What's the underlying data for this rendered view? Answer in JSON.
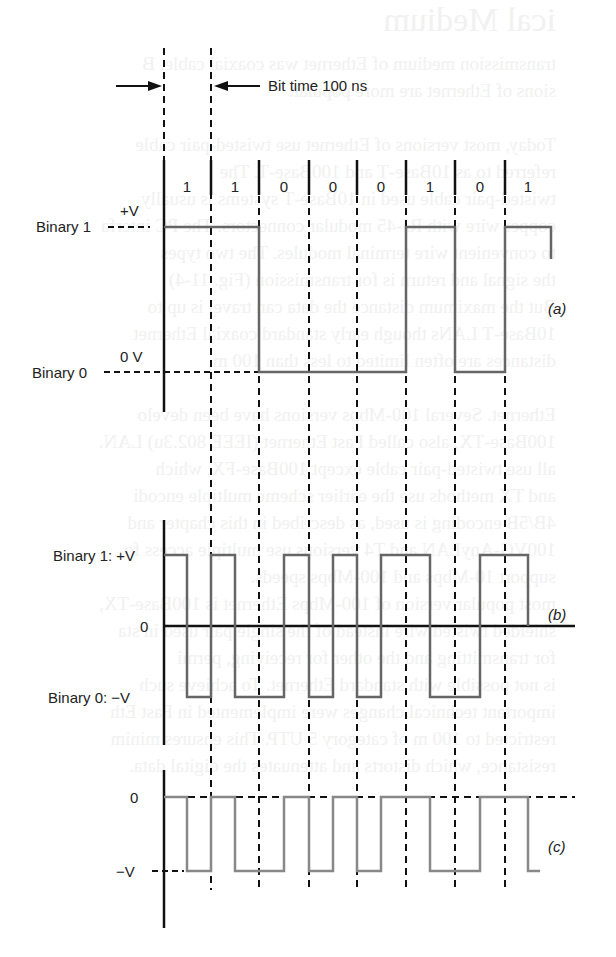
{
  "figure": {
    "bit_time_label": "Bit time 100 ns",
    "bits": [
      "1",
      "1",
      "0",
      "0",
      "0",
      "1",
      "0",
      "1"
    ],
    "panels": {
      "a": {
        "label": "(a)",
        "binary1_label": "Binary 1",
        "plus_v_label": "+V",
        "binary0_label": "Binary 0",
        "zero_v_label": "0 V",
        "encoding": "NRZ unipolar"
      },
      "b": {
        "label": "(b)",
        "binary1_label": "Binary 1: +V",
        "zero_label": "0",
        "binary0_label": "Binary 0: −V",
        "encoding": "Manchester bipolar"
      },
      "c": {
        "label": "(c)",
        "zero_label": "0",
        "minus_v_label": "−V",
        "encoding": "Manchester single-polarity (negative)"
      }
    }
  },
  "background_bleed_text": [
    "ical Medium",
    "transmission medium of Ethernet was coaxial cable. B",
    "sions of Ethernet are more popular.",
    "",
    "Today, most versions of Ethernet use twisted-pair cable",
    "referred to as 10Base-T and 100Base-T. The",
    "twisted-pair cable used in 10Base-T systems is usually",
    "copper wire with RJ-45 modular connectors. The PC interfa",
    "to convenient wire terminal modules. The two types",
    "the signal and return is for transmission (Fig. 11-4)",
    "But the maximum distance the data can travel is up to",
    "10Base-T LANs though early standard coaxial Ethernet",
    "distances are often limited to less than 100 m.",
    "",
    "Ethernet. Several 100-Mbps versions have been develo",
    "100Base-TX, also called Fast Ethernet (IEEE 802.3u) LAN.",
    "all use twisted-pair cable except 100Base-FX, which",
    "and TX methods use the earlier scheme multiple encodi",
    "4B/5B encoding is used, as described in this chapter and",
    "100VG-AnyLAN and T4 versions use multiple access fo",
    "support 10-Mbps and 100-Mbps speeds.",
    "most popular version of 100-Mbps Ethernet is 100Base-TX,",
    "shielded twisted wire instead of the single pair used in sta",
    "for transmitting and the other for receiving, permi",
    "is not possible with standard Ethernet. To achieve such",
    "important technical changes were implemented in Fast Eth",
    "restricted to 100 m of category 5 UTP. This ensures minim",
    "resistance, which distorts and attenuates the digital data."
  ]
}
